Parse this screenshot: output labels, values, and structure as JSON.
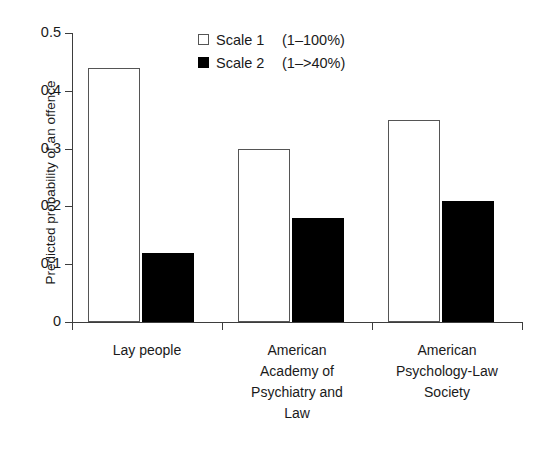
{
  "chart_data": {
    "type": "bar",
    "title": "",
    "xlabel": "",
    "ylabel": "Predicted probability of an offence",
    "ylim": [
      0,
      0.5
    ],
    "yticks": [
      "0",
      "0.1",
      "0.2",
      "0.3",
      "0.4",
      "0.5"
    ],
    "ytick_values": [
      0,
      0.1,
      0.2,
      0.3,
      0.4,
      0.5
    ],
    "grid": false,
    "legend_position": "top-center",
    "categories": [
      "Lay people",
      "American\nAcademy of\nPsychiatry and\nLaw",
      "American\nPsychology-Law\nSociety"
    ],
    "series": [
      {
        "name": "Scale 1",
        "range_label": "(1–100%)",
        "fill": "#ffffff",
        "edge": "#555555",
        "values": [
          0.44,
          0.3,
          0.35
        ]
      },
      {
        "name": "Scale 2",
        "range_label": "(1–>40%)",
        "fill": "#000000",
        "edge": "#000000",
        "values": [
          0.12,
          0.18,
          0.21
        ]
      }
    ]
  },
  "legend": {
    "items": [
      {
        "name": "Scale 1",
        "range": "(1–100%)"
      },
      {
        "name": "Scale 2",
        "range": "(1–>40%)"
      }
    ]
  },
  "axis": {
    "y_title": "Predicted probability of an offence",
    "y_labels": [
      "0.5",
      "0.4",
      "0.3",
      "0.2",
      "0.1",
      "0"
    ]
  },
  "categories": [
    "Lay people",
    "American\nAcademy of\nPsychiatry and\nLaw",
    "American\nPsychology-Law\nSociety"
  ]
}
